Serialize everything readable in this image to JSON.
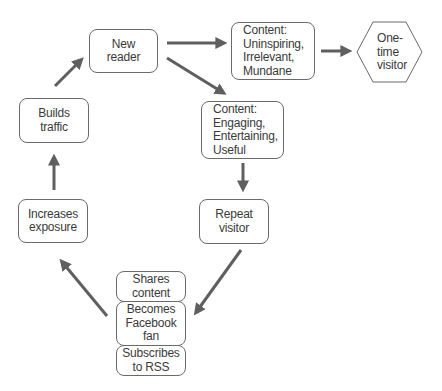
{
  "diagram": {
    "nodes": {
      "new_reader": {
        "lines": [
          "New",
          "reader"
        ]
      },
      "content_bad": {
        "lines": [
          "Content:",
          "Uninspiring,",
          "Irrelevant,",
          "Mundane"
        ]
      },
      "one_time_visitor": {
        "lines": [
          "One-",
          "time",
          "visitor"
        ],
        "shape": "hexagon"
      },
      "content_good": {
        "lines": [
          "Content:",
          "Engaging,",
          "Entertaining,",
          "Useful"
        ]
      },
      "repeat_visitor": {
        "lines": [
          "Repeat",
          "visitor"
        ]
      },
      "shares_content": {
        "lines": [
          "Shares",
          "content"
        ]
      },
      "facebook_fan": {
        "lines": [
          "Becomes",
          "Facebook",
          "fan"
        ]
      },
      "subscribes_rss": {
        "lines": [
          "Subscribes",
          "to RSS"
        ]
      },
      "increases_exposure": {
        "lines": [
          "Increases",
          "exposure"
        ]
      },
      "builds_traffic": {
        "lines": [
          "Builds",
          "traffic"
        ]
      }
    },
    "edges": [
      {
        "from": "New reader",
        "to": "Content: Uninspiring, Irrelevant, Mundane"
      },
      {
        "from": "New reader",
        "to": "Content: Engaging, Entertaining, Useful"
      },
      {
        "from": "Content: Uninspiring, Irrelevant, Mundane",
        "to": "One-time visitor"
      },
      {
        "from": "Content: Engaging, Entertaining, Useful",
        "to": "Repeat visitor"
      },
      {
        "from": "Repeat visitor",
        "to": "Shares content / Becomes Facebook fan / Subscribes to RSS"
      },
      {
        "from": "Shares content / Becomes Facebook fan / Subscribes to RSS",
        "to": "Increases exposure"
      },
      {
        "from": "Increases exposure",
        "to": "Builds traffic"
      },
      {
        "from": "Builds traffic",
        "to": "New reader"
      }
    ],
    "colors": {
      "arrow": "#5f5f5f",
      "border": "#6a6a6a",
      "text": "#3a3a3a",
      "background": "#ffffff"
    }
  }
}
